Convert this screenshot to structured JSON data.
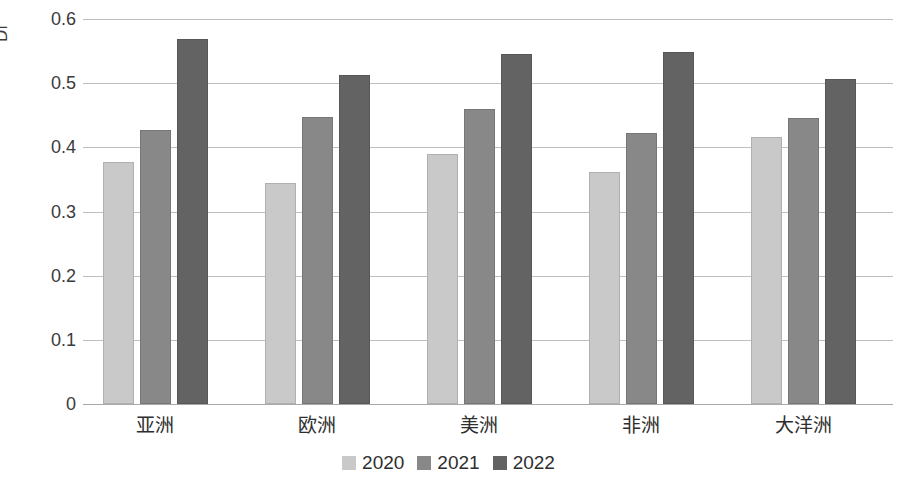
{
  "chart_data": {
    "type": "bar",
    "title": "",
    "subtitle": "",
    "xlabel": "",
    "ylabel": "Di",
    "ylim": [
      0,
      0.6
    ],
    "ytick_labels": [
      "0.6",
      "0.5",
      "0.4",
      "0.3",
      "0.2",
      "0.1",
      "0"
    ],
    "ytick_values": [
      0.6,
      0.5,
      0.4,
      0.3,
      0.2,
      0.1,
      0
    ],
    "grid": true,
    "legend_position": "bottom",
    "categories": [
      "亚洲",
      "欧洲",
      "美洲",
      "非洲",
      "大洋洲"
    ],
    "series": [
      {
        "name": "2020",
        "color": "#c9c9c9",
        "values": [
          0.377,
          0.345,
          0.389,
          0.362,
          0.416
        ]
      },
      {
        "name": "2021",
        "color": "#888888",
        "values": [
          0.427,
          0.447,
          0.459,
          0.423,
          0.446
        ]
      },
      {
        "name": "2022",
        "color": "#636363",
        "values": [
          0.569,
          0.512,
          0.546,
          0.548,
          0.506
        ]
      }
    ]
  },
  "legend": {
    "items": [
      {
        "label": "2020",
        "color": "#c9c9c9"
      },
      {
        "label": "2021",
        "color": "#888888"
      },
      {
        "label": "2022",
        "color": "#636363"
      }
    ]
  },
  "colors": {
    "background": "#ffffff",
    "gridline": "#bfbfbf",
    "axis_text": "#3a3a3a",
    "category_text": "#2e2e2e"
  }
}
